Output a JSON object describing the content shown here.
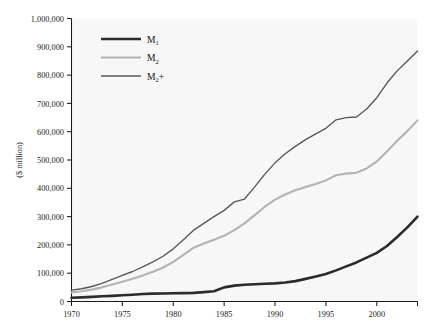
{
  "chart_data": {
    "type": "line",
    "title": "",
    "xlabel": "",
    "ylabel": "($ million)",
    "xlim": [
      1970,
      2004
    ],
    "ylim": [
      0,
      1000000
    ],
    "grid": false,
    "legend_position": "top-left-inside",
    "x_tick_labels": [
      "1970",
      "1975",
      "1980",
      "1985",
      "1990",
      "1995",
      "2000"
    ],
    "x_tick_values": [
      1970,
      1975,
      1980,
      1985,
      1990,
      1995,
      2000
    ],
    "y_tick_labels": [
      "0",
      "100,000",
      "200,000",
      "300,000",
      "400,000",
      "500,000",
      "600,000",
      "700,000",
      "800,000",
      "900,000",
      "1,000,000"
    ],
    "y_tick_values": [
      0,
      100000,
      200000,
      300000,
      400000,
      500000,
      600000,
      700000,
      800000,
      900000,
      1000000
    ],
    "x": [
      1970,
      1971,
      1972,
      1973,
      1974,
      1975,
      1976,
      1977,
      1978,
      1979,
      1980,
      1981,
      1982,
      1983,
      1984,
      1985,
      1986,
      1987,
      1988,
      1989,
      1990,
      1991,
      1992,
      1993,
      1994,
      1995,
      1996,
      1997,
      1998,
      1999,
      2000,
      2001,
      2002,
      2003,
      2004
    ],
    "series": [
      {
        "name": "M1",
        "label": "M",
        "sublabel": "1",
        "color": "#2b2b2b",
        "width": 2.6,
        "values": [
          13000,
          14500,
          16500,
          18500,
          20000,
          22000,
          24000,
          26500,
          28000,
          28500,
          29000,
          29500,
          30500,
          33000,
          36000,
          50000,
          56000,
          59000,
          61000,
          62500,
          64000,
          67000,
          72000,
          80000,
          88000,
          97000,
          110000,
          124000,
          138000,
          155000,
          172000,
          196000,
          228000,
          262000,
          300000
        ]
      },
      {
        "name": "M2",
        "label": "M",
        "sublabel": "2",
        "color": "#b3b3b3",
        "width": 2.1,
        "values": [
          32000,
          36000,
          42000,
          50000,
          60000,
          70000,
          80000,
          92000,
          105000,
          120000,
          140000,
          165000,
          190000,
          205000,
          218000,
          232000,
          252000,
          276000,
          305000,
          335000,
          360000,
          378000,
          393000,
          405000,
          415000,
          428000,
          446000,
          452000,
          455000,
          470000,
          495000,
          530000,
          568000,
          602000,
          640000
        ]
      },
      {
        "name": "M2+",
        "label": "M",
        "sublabel": "2",
        "suffix": "+",
        "color": "#575757",
        "width": 1.35,
        "values": [
          40000,
          45000,
          53000,
          64000,
          78000,
          92000,
          106000,
          122000,
          140000,
          160000,
          186000,
          218000,
          252000,
          276000,
          300000,
          322000,
          352000,
          362000,
          405000,
          450000,
          490000,
          522000,
          548000,
          572000,
          592000,
          612000,
          642000,
          650000,
          652000,
          680000,
          720000,
          772000,
          815000,
          850000,
          885000
        ]
      }
    ]
  },
  "legend": {
    "entries": [
      {
        "label": "M",
        "sublabel": "1",
        "suffix": ""
      },
      {
        "label": "M",
        "sublabel": "2",
        "suffix": ""
      },
      {
        "label": "M",
        "sublabel": "2",
        "suffix": "+"
      }
    ]
  },
  "colors": {
    "m1": "#2b2b2b",
    "m2": "#b3b3b3",
    "m2plus": "#575757",
    "axis": "#1a1a1a",
    "plot_background": "#f7f7f7",
    "page_background": "#ffffff"
  }
}
